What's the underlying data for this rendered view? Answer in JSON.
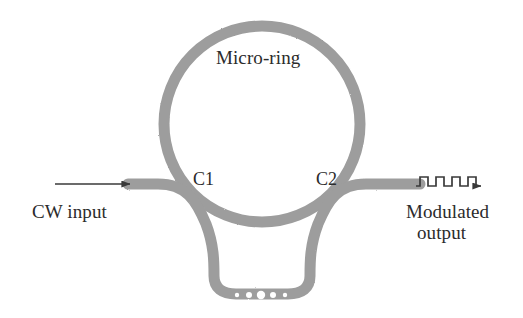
{
  "figure": {
    "kind": "schematic-diagram",
    "width": 523,
    "height": 318,
    "background_color": "#ffffff"
  },
  "colors": {
    "waveguide_gray": "#9d9d9d",
    "waveguide_gray_light": "#b4b4b4",
    "text_dark": "#2b2b2b",
    "arrow_dark": "#3a3a3a",
    "dot_white": "#ffffff"
  },
  "labels": {
    "micro_ring": "Micro-ring",
    "coupler_1": "C1",
    "coupler_2": "C2",
    "input": "CW input",
    "output_line1": "Modulated",
    "output_line2": "output"
  },
  "components": {
    "ring": {
      "name": "micro-ring resonator",
      "center_x": 262,
      "center_y": 124,
      "radius": 98,
      "stroke_width": 11
    },
    "bus_waveguide": {
      "name": "bus waveguide",
      "stroke_width": 11,
      "description": "single continuous waveguide entering at left, dipping below the ring, and exiting at right"
    },
    "coupling_regions": [
      {
        "id": "C1",
        "label": "C1",
        "x": 200,
        "y": 186
      },
      {
        "id": "C2",
        "label": "C2",
        "x": 324,
        "y": 186
      }
    ],
    "electrode_dots": {
      "name": "pn-junction dots",
      "count": 5,
      "color": "#ffffff",
      "center_x": 261,
      "center_y": 296,
      "spacing": 12,
      "radii": [
        2.2,
        3.0,
        4.2,
        3.0,
        2.2
      ]
    },
    "input_arrow": {
      "name": "cw-input-arrow",
      "x1": 55,
      "y1": 184,
      "x2": 131,
      "y2": 184,
      "style": "straight line with solid arrowhead"
    },
    "output_waveform_arrow": {
      "name": "modulated-output-square-wave-arrow",
      "style": "square wave then solid arrowhead",
      "periods": 4,
      "x_start": 418,
      "x_end": 478,
      "baseline_y": 186,
      "amplitude": 9
    }
  }
}
